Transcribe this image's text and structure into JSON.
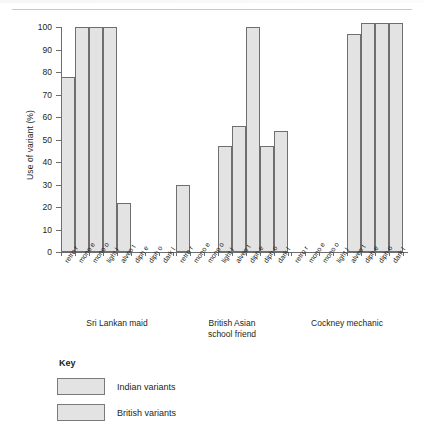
{
  "chart_data": {
    "type": "bar",
    "title": "",
    "xlabel": "",
    "ylabel": "Use of variant (%)",
    "ylim": [
      0,
      100
    ],
    "yticks": [
      0,
      10,
      20,
      30,
      40,
      50,
      60,
      70,
      80,
      90,
      100
    ],
    "grid": false,
    "legend_position": "bottom-left",
    "categories": [
      "retro r",
      "mono e",
      "mono o",
      "light l",
      "alveo t",
      "diph e",
      "diph o",
      "dark l"
    ],
    "category_types": [
      "Indian variants",
      "Indian variants",
      "Indian variants",
      "Indian variants",
      "British variants",
      "British variants",
      "British variants",
      "British variants"
    ],
    "groups": [
      {
        "name": "Sri Lankan maid",
        "values": [
          78,
          100,
          100,
          100,
          22,
          0,
          0,
          0
        ]
      },
      {
        "name": "British Asian school friend",
        "values": [
          30,
          0,
          0,
          47,
          56,
          100,
          47,
          54
        ]
      },
      {
        "name": "Cockney mechanic",
        "values": [
          0,
          0,
          0,
          0,
          97,
          102,
          102,
          102
        ]
      }
    ],
    "colors": {
      "bar_fill": "#e3e3e3",
      "bar_edge": "#6f6f6f",
      "axis": "#6d6d6d",
      "text": "#231f20"
    }
  },
  "legend": {
    "title": "Key",
    "entries": [
      {
        "label": "Indian variants",
        "color": "#e3e3e3"
      },
      {
        "label": "British variants",
        "color": "#e3e3e3"
      }
    ]
  },
  "group_captions": [
    {
      "line1": "Sri Lankan maid",
      "line2": ""
    },
    {
      "line1": "British Asian",
      "line2": "school friend"
    },
    {
      "line1": "Cockney mechanic",
      "line2": ""
    }
  ]
}
